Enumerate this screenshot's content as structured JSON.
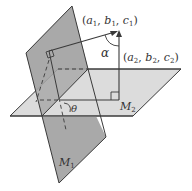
{
  "diagram": {
    "type": "geometry-planes-angle",
    "labels": {
      "normal1": "(a₁, b₁, c₁)",
      "normal2": "(a₂, b₂, c₂)",
      "alpha": "α",
      "theta": "θ",
      "plane1": "M₁",
      "plane2": "M₂"
    },
    "colors": {
      "plane1_fill": "#a9a9a9",
      "plane2_fill": "#dcdcdc",
      "stroke": "#3a3a3a",
      "text": "#333333"
    }
  }
}
